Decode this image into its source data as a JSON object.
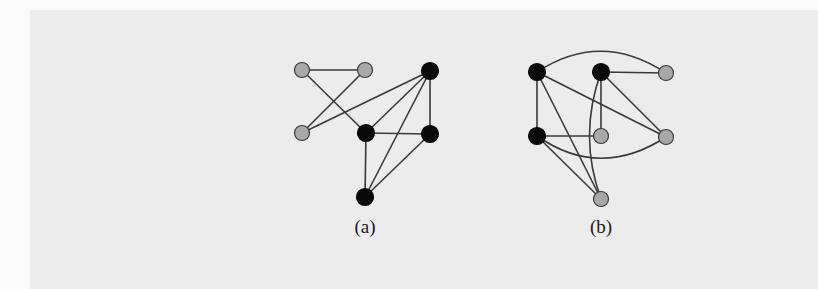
{
  "figure": {
    "colors": {
      "page_background": "#fafafa",
      "overlay_background": "#ececec",
      "edge": "#3a3a3a",
      "node_black": "#0a0a0a",
      "node_gray": "#a8a8a8",
      "node_outline": "#3a3a3a"
    },
    "subfigures": [
      {
        "id": "a",
        "label": "(a)",
        "label_pos": {
          "x": 365,
          "y": 231
        },
        "nodes": [
          {
            "id": "a-g1",
            "x": 302,
            "y": 70,
            "color": "gray"
          },
          {
            "id": "a-g2",
            "x": 365,
            "y": 70,
            "color": "gray"
          },
          {
            "id": "a-g3",
            "x": 302,
            "y": 133,
            "color": "gray"
          },
          {
            "id": "a-b1",
            "x": 430,
            "y": 71,
            "color": "black"
          },
          {
            "id": "a-b2",
            "x": 366,
            "y": 133,
            "color": "black"
          },
          {
            "id": "a-b3",
            "x": 430,
            "y": 134,
            "color": "black"
          },
          {
            "id": "a-b4",
            "x": 365,
            "y": 197,
            "color": "black"
          }
        ],
        "edges": [
          {
            "from": "a-g1",
            "to": "a-g2"
          },
          {
            "from": "a-g1",
            "to": "a-b2"
          },
          {
            "from": "a-g2",
            "to": "a-g3"
          },
          {
            "from": "a-g3",
            "to": "a-b1"
          },
          {
            "from": "a-b1",
            "to": "a-b2"
          },
          {
            "from": "a-b1",
            "to": "a-b4"
          },
          {
            "from": "a-b1",
            "to": "a-b3"
          },
          {
            "from": "a-b2",
            "to": "a-b3"
          },
          {
            "from": "a-b2",
            "to": "a-b4"
          },
          {
            "from": "a-b3",
            "to": "a-b4"
          }
        ]
      },
      {
        "id": "b",
        "label": "(b)",
        "label_pos": {
          "x": 601,
          "y": 231
        },
        "nodes": [
          {
            "id": "b-b1",
            "x": 537,
            "y": 72,
            "color": "black"
          },
          {
            "id": "b-b2",
            "x": 601,
            "y": 72,
            "color": "black"
          },
          {
            "id": "b-g1",
            "x": 666,
            "y": 73,
            "color": "gray"
          },
          {
            "id": "b-b3",
            "x": 537,
            "y": 136,
            "color": "black"
          },
          {
            "id": "b-g2",
            "x": 601,
            "y": 136,
            "color": "gray"
          },
          {
            "id": "b-g3",
            "x": 666,
            "y": 137,
            "color": "gray"
          },
          {
            "id": "b-g4",
            "x": 601,
            "y": 199,
            "color": "gray"
          }
        ],
        "edges": [
          {
            "from": "b-b1",
            "to": "b-g1",
            "curve": {
              "cx": 601,
              "cy": 30
            }
          },
          {
            "from": "b-b2",
            "to": "b-g1"
          },
          {
            "from": "b-b1",
            "to": "b-b3"
          },
          {
            "from": "b-b1",
            "to": "b-g3"
          },
          {
            "from": "b-b1",
            "to": "b-g4"
          },
          {
            "from": "b-b2",
            "to": "b-g2"
          },
          {
            "from": "b-b2",
            "to": "b-g3"
          },
          {
            "from": "b-b2",
            "to": "b-g4",
            "curve": {
              "cx": 578,
              "cy": 136
            }
          },
          {
            "from": "b-b3",
            "to": "b-g2"
          },
          {
            "from": "b-b3",
            "to": "b-g3",
            "curve": {
              "cx": 600,
              "cy": 180
            }
          },
          {
            "from": "b-b3",
            "to": "b-g4"
          }
        ]
      }
    ]
  }
}
